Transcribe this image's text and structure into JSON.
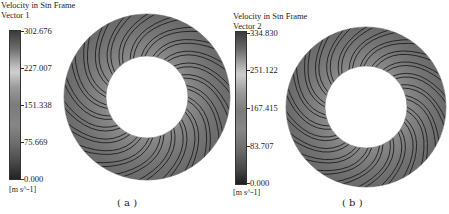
{
  "panels": [
    {
      "id": "a",
      "legend": {
        "title_line1": "Velocity in Stn Frame",
        "title_line2": "Vector 1",
        "ticks": [
          "302.676",
          "227.007",
          "151.338",
          "75.669",
          "0.000"
        ],
        "units": "[m s^-1]"
      },
      "caption": "( a )"
    },
    {
      "id": "b",
      "legend": {
        "title_line1": "Velocity in Stn Frame",
        "title_line2": "Vector 2",
        "ticks": [
          "334.830",
          "251.122",
          "167.415",
          "83.707",
          "0.000"
        ],
        "units": "[m s^-1]"
      },
      "caption": "( b )"
    }
  ],
  "colors": {
    "ring_fill": "#7a7a7a",
    "blade_lines": "#1e1e1e",
    "background": "#ffffff"
  }
}
